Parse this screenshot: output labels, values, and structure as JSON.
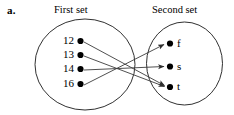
{
  "figure": {
    "part_label": "a.",
    "type": "mapping-diagram",
    "left_set": {
      "title": "First set",
      "elements": [
        {
          "label": "12",
          "id": "l1"
        },
        {
          "label": "13",
          "id": "l2"
        },
        {
          "label": "14",
          "id": "l3"
        },
        {
          "label": "16",
          "id": "l4"
        }
      ]
    },
    "right_set": {
      "title": "Second set",
      "elements": [
        {
          "label": "f",
          "id": "r1"
        },
        {
          "label": "s",
          "id": "r2"
        },
        {
          "label": "t",
          "id": "r3"
        }
      ]
    },
    "arrows": [
      {
        "from": "12",
        "to": "t"
      },
      {
        "from": "13",
        "to": "t"
      },
      {
        "from": "14",
        "to": "s"
      },
      {
        "from": "16",
        "to": "f"
      }
    ],
    "colors": {
      "ink": "#000000",
      "line": "#3c3c3c",
      "background": "#ffffff"
    }
  }
}
